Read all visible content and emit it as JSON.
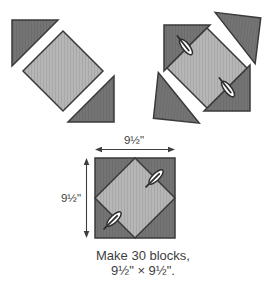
{
  "diagram": {
    "kind": "quilt-block-assembly-instructions",
    "dimensions": {
      "width_label": "9½\"",
      "height_label": "9½\""
    },
    "caption": {
      "line1": "Make 30 blocks,",
      "line2": "9½\" × 9½\"."
    },
    "icons": {
      "pin": "basting-pin-icon"
    }
  },
  "colors": {
    "dark_fabric": "#747474",
    "light_fabric": "#b6b6b6",
    "outline": "#3a3a3a",
    "pin_fill": "#ffffff",
    "pin_outline": "#2e2e2e",
    "text_color": "#3e3e3e",
    "background": "#ffffff"
  }
}
